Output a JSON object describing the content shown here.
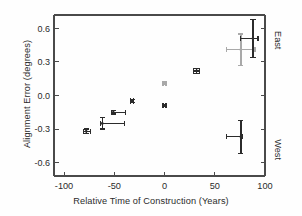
{
  "chart_data": {
    "type": "scatter",
    "title": "",
    "xlabel": "Relative Time of Construction (Years)",
    "ylabel": "Alignment Error (degrees)",
    "xlim": [
      -110,
      100
    ],
    "ylim": [
      -0.72,
      0.72
    ],
    "xticks": [
      -100,
      -50,
      0,
      50,
      100
    ],
    "xticklabels": [
      "-100",
      "-50",
      "0",
      "50",
      "100"
    ],
    "yticks": [
      0.6,
      0.3,
      0.0,
      -0.3,
      -0.6
    ],
    "yticklabels": [
      "0.6",
      "0.3",
      "0.0",
      "-0.3",
      "-0.6"
    ],
    "grid": false,
    "legend": null,
    "right_axis_annotations": [
      {
        "label": "East",
        "position": "top"
      },
      {
        "label": "West",
        "position": "bottom"
      }
    ],
    "marker": "point-with-error-bars",
    "points": [
      {
        "x": -78,
        "y": -0.32,
        "xerr_low": 3,
        "xerr_high": 4,
        "yerr_low": 0.02,
        "yerr_high": 0.02,
        "shade": "dark"
      },
      {
        "x": -62,
        "y": -0.25,
        "xerr_low": 2,
        "xerr_high": 22,
        "yerr_low": 0.05,
        "yerr_high": 0.05,
        "shade": "dark"
      },
      {
        "x": -51,
        "y": -0.15,
        "xerr_low": 2,
        "xerr_high": 12,
        "yerr_low": 0.015,
        "yerr_high": 0.015,
        "shade": "dark"
      },
      {
        "x": -32,
        "y": -0.05,
        "xerr_low": 1.5,
        "xerr_high": 1.5,
        "yerr_low": 0.012,
        "yerr_high": 0.012,
        "shade": "dark"
      },
      {
        "x": 0,
        "y": 0.11,
        "xerr_low": 1.5,
        "xerr_high": 1.5,
        "yerr_low": 0.012,
        "yerr_high": 0.012,
        "shade": "light"
      },
      {
        "x": 0,
        "y": -0.09,
        "xerr_low": 1.5,
        "xerr_high": 1.5,
        "yerr_low": 0.012,
        "yerr_high": 0.012,
        "shade": "dark"
      },
      {
        "x": 32,
        "y": 0.22,
        "xerr_low": 3,
        "xerr_high": 3,
        "yerr_low": 0.025,
        "yerr_high": 0.025,
        "shade": "dark"
      },
      {
        "x": 76,
        "y": 0.41,
        "xerr_low": 14,
        "xerr_high": 14,
        "yerr_low": 0.14,
        "yerr_high": 0.14,
        "shade": "light"
      },
      {
        "x": 88,
        "y": 0.51,
        "xerr_low": 12,
        "xerr_high": 5,
        "yerr_low": 0.17,
        "yerr_high": 0.17,
        "shade": "dark"
      },
      {
        "x": 76,
        "y": -0.37,
        "xerr_low": 14,
        "xerr_high": 2,
        "yerr_low": 0.15,
        "yerr_high": 0.15,
        "shade": "dark"
      }
    ]
  },
  "colors": {
    "axis": "#4a4a4a",
    "text": "#2b2b2b",
    "marker_dark": "#2b2b2b",
    "marker_light": "#a9a9a9",
    "background": "#fefefe"
  }
}
